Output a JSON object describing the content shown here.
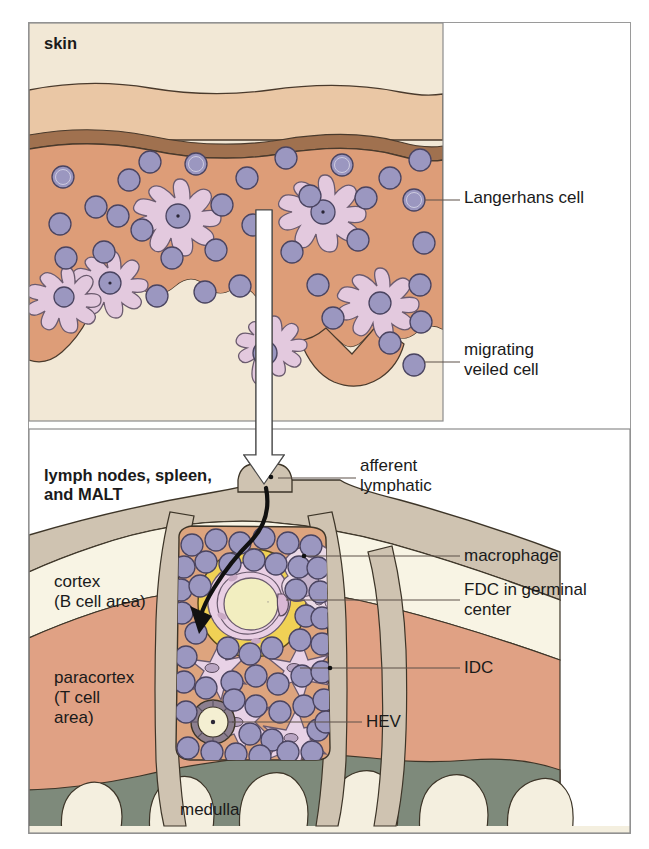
{
  "figure": {
    "title_skin": "skin",
    "title_lymphoid": "lymph nodes, spleen,\nand MALT"
  },
  "labels": {
    "langerhans": "Langerhans cell",
    "veiled": "migrating\nveiled cell",
    "afferent": "afferent\nlymphatic",
    "macrophage": "macrophage",
    "fdc": "FDC in germinal\ncenter",
    "idc": "IDC",
    "hev": "HEV",
    "cortex": "cortex\n(B cell area)",
    "paracortex": "paracortex\n(T cell\narea)",
    "medulla": "medulla"
  },
  "colors": {
    "frame_border": "#9a9a9a",
    "epidermis": "#eac7a5",
    "epidermis_band": "#a0714f",
    "dermis": "#dd9d78",
    "subcutis": "#f0e6d2",
    "lymphocyte_fill": "#9b97c0",
    "lymphocyte_stroke": "#4a4460",
    "dendritic_fill": "#e3c9de",
    "capsule": "#cfc3b1",
    "cortex": "#f8f4e4",
    "paracortex": "#e0a184",
    "medulla": "#7e8a7b",
    "sinus": "#f4efdf",
    "follicle_bg": "#dda47e",
    "germinal_ring": "#f0d155",
    "germinal_fdc": "#e9cfe4",
    "germinal_core": "#f2eec0",
    "macrophage_fill": "#ead9e6",
    "arrow_white": "#ffffff",
    "arrow_black": "#111111",
    "leader_line": "#5c5148"
  },
  "structures": {
    "skin_panel": "skin cross-section: epidermis, dermis with Langerhans cells, subcutaneous tissue",
    "lymphoid_panel": "lymph node cross-section: capsule, cortex, paracortex, medulla, follicle with germinal center",
    "flow_arrow": "white hollow arrow from skin down into afferent lymphatic",
    "migration_arrow": "black curved arrow from afferent lymphatic into follicle"
  }
}
